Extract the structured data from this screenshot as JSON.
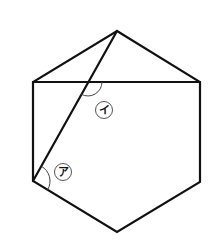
{
  "figure": {
    "colors": {
      "line": "#111111",
      "arc": "#444444",
      "background": "#ffffff"
    },
    "vertices": {
      "top": [
        117,
        31
      ],
      "upper_right": [
        200,
        82
      ],
      "lower_right": [
        200,
        182
      ],
      "bottom": [
        117,
        232
      ],
      "lower_left": [
        33,
        181
      ],
      "upper_left": [
        33,
        82
      ]
    },
    "chord": {
      "from": "upper_left",
      "to": "upper_right"
    },
    "diagonal": {
      "from": "top",
      "to": "lower_left"
    },
    "intersection": [
      88,
      82
    ],
    "angles": [
      {
        "id": "a",
        "label": "ア",
        "at": "lower_left",
        "between": [
          "diagonal",
          "lower_left-bottom edge"
        ],
        "label_pos": [
          63,
          172
        ]
      },
      {
        "id": "i",
        "label": "イ",
        "at": "intersection",
        "between": [
          "diagonal (downward)",
          "chord (rightward)"
        ],
        "label_pos": [
          104,
          110
        ]
      }
    ]
  }
}
